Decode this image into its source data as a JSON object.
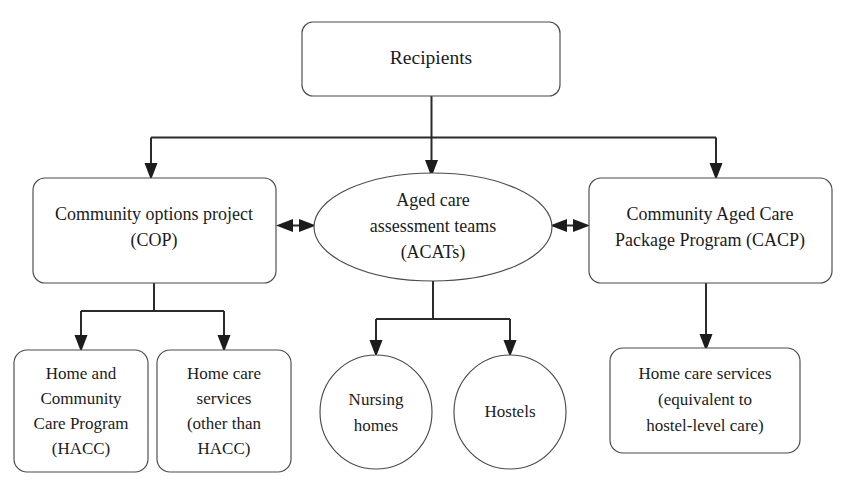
{
  "diagram": {
    "type": "flowchart",
    "title_node": "Recipients",
    "orientation": "top-down",
    "colors": {
      "node_fill": "#ffffff",
      "node_stroke": "#4a4a4a",
      "connector": "#2b2b2b",
      "text": "#1b1b1b"
    },
    "nodes": [
      {
        "id": "recipients",
        "shape": "rounded-rect",
        "lines": [
          "Recipients"
        ],
        "x": 302,
        "y": 22,
        "w": 258,
        "h": 74,
        "font": "t-lg"
      },
      {
        "id": "cop",
        "shape": "rounded-rect",
        "lines": [
          "Community options project",
          "(COP)"
        ],
        "x": 33,
        "y": 178,
        "w": 243,
        "h": 105,
        "font": "t-md"
      },
      {
        "id": "acats",
        "shape": "ellipse",
        "lines": [
          "Aged care",
          "assessment teams",
          "(ACATs)"
        ],
        "cx": 433,
        "cy": 227,
        "rx": 119,
        "ry": 54,
        "font": "t-md"
      },
      {
        "id": "cacp",
        "shape": "rounded-rect",
        "lines": [
          "Community Aged Care",
          "Package Program (CACP)"
        ],
        "x": 589,
        "y": 178,
        "w": 243,
        "h": 105,
        "font": "t-md"
      },
      {
        "id": "hacc",
        "shape": "rounded-rect",
        "lines": [
          "Home and",
          "Community",
          "Care Program",
          "(HACC)"
        ],
        "x": 14,
        "y": 350,
        "w": 134,
        "h": 122,
        "font": "t-sm"
      },
      {
        "id": "other-than-hacc",
        "shape": "rounded-rect",
        "lines": [
          "Home care",
          "services",
          "(other than",
          "HACC)"
        ],
        "x": 157,
        "y": 350,
        "w": 134,
        "h": 122,
        "font": "t-sm"
      },
      {
        "id": "nursing-homes",
        "shape": "circle",
        "lines": [
          "Nursing",
          "homes"
        ],
        "cx": 376,
        "cy": 412,
        "rx": 55,
        "ry": 56,
        "font": "t-sm"
      },
      {
        "id": "hostels",
        "shape": "circle",
        "lines": [
          "Hostels"
        ],
        "cx": 510,
        "cy": 412,
        "rx": 55,
        "ry": 56,
        "font": "t-sm"
      },
      {
        "id": "hostel-level-care",
        "shape": "rounded-rect",
        "lines": [
          "Home care services",
          "(equivalent to",
          "hostel-level care)"
        ],
        "x": 610,
        "y": 348,
        "w": 190,
        "h": 105,
        "font": "t-sm"
      }
    ],
    "edges": [
      {
        "id": "recipients-to-cop",
        "from": "recipients",
        "to": "cop",
        "style": "orthogonal",
        "arrow": "end"
      },
      {
        "id": "recipients-to-acats",
        "from": "recipients",
        "to": "acats",
        "style": "straight",
        "arrow": "end"
      },
      {
        "id": "recipients-to-cacp",
        "from": "recipients",
        "to": "cacp",
        "style": "orthogonal",
        "arrow": "end"
      },
      {
        "id": "cop-acats-link",
        "from": "cop",
        "to": "acats",
        "style": "straight",
        "arrow": "both"
      },
      {
        "id": "acats-cacp-link",
        "from": "acats",
        "to": "cacp",
        "style": "straight",
        "arrow": "both"
      },
      {
        "id": "cop-to-hacc",
        "from": "cop",
        "to": "hacc",
        "style": "orthogonal",
        "arrow": "end"
      },
      {
        "id": "cop-to-other-than-hacc",
        "from": "cop",
        "to": "other-than-hacc",
        "style": "orthogonal",
        "arrow": "end"
      },
      {
        "id": "acats-to-nursing-homes",
        "from": "acats",
        "to": "nursing-homes",
        "style": "orthogonal",
        "arrow": "end"
      },
      {
        "id": "acats-to-hostels",
        "from": "acats",
        "to": "hostels",
        "style": "orthogonal",
        "arrow": "end"
      },
      {
        "id": "cacp-to-hostel-level-care",
        "from": "cacp",
        "to": "hostel-level-care",
        "style": "straight",
        "arrow": "end"
      }
    ]
  },
  "labels": {
    "recipients": "Recipients",
    "cop_line1": "Community options project",
    "cop_line2": "(COP)",
    "acats_line1": "Aged care",
    "acats_line2": "assessment teams",
    "acats_line3": "(ACATs)",
    "cacp_line1": "Community Aged Care",
    "cacp_line2": "Package Program (CACP)",
    "hacc_line1": "Home and",
    "hacc_line2": "Community",
    "hacc_line3": "Care Program",
    "hacc_line4": "(HACC)",
    "other_line1": "Home care",
    "other_line2": "services",
    "other_line3": "(other than",
    "other_line4": "HACC)",
    "nursing_line1": "Nursing",
    "nursing_line2": "homes",
    "hostels_line1": "Hostels",
    "hlc_line1": "Home care services",
    "hlc_line2": "(equivalent to",
    "hlc_line3": "hostel-level care)"
  }
}
